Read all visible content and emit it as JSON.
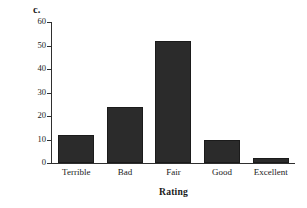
{
  "figure": {
    "panel_label": "c.",
    "background_color": "#ffffff",
    "bar_color": "#2b2b2b",
    "axis_color": "#2f2f2f"
  },
  "chart_data": {
    "type": "bar",
    "title": "",
    "subtitle": "",
    "xlabel": "Rating",
    "ylabel": "Percent Frequency",
    "categories": [
      "Terrible",
      "Bad",
      "Fair",
      "Good",
      "Excellent"
    ],
    "values": [
      12,
      24,
      52,
      10,
      2
    ],
    "series": [
      {
        "name": "Percent Frequency",
        "values": [
          12,
          24,
          52,
          10,
          2
        ]
      }
    ],
    "ylim": [
      0,
      60
    ],
    "yticks": [
      0,
      10,
      20,
      30,
      40,
      50,
      60
    ],
    "ytick_labels": [
      "0",
      "10",
      "20",
      "30",
      "40",
      "50",
      "60"
    ],
    "grid": false,
    "legend": false,
    "legend_position": "none",
    "annotations": [
      "c."
    ]
  }
}
